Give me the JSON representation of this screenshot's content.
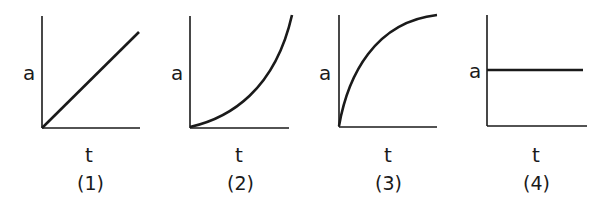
{
  "figure": {
    "panels": [
      {
        "id": "1",
        "caption": "(1)",
        "x_label": "t",
        "y_label": "a",
        "curve": "linear-increasing"
      },
      {
        "id": "2",
        "caption": "(2)",
        "x_label": "t",
        "y_label": "a",
        "curve": "concave-up-increasing"
      },
      {
        "id": "3",
        "caption": "(3)",
        "x_label": "t",
        "y_label": "a",
        "curve": "concave-down-saturating"
      },
      {
        "id": "4",
        "caption": "(4)",
        "x_label": "t",
        "y_label": "a",
        "curve": "constant"
      }
    ],
    "colors": {
      "line": "#1a1a1a",
      "background": "#ffffff"
    }
  }
}
